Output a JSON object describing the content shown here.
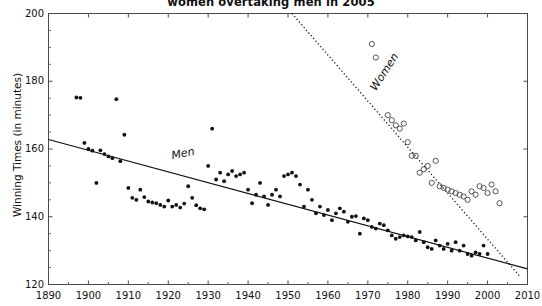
{
  "chart_data": {
    "type": "scatter",
    "title": "women overtaking men in 2005",
    "xlabel": "",
    "ylabel": "Winning Times (in minutes)",
    "xlim": [
      1890,
      2010
    ],
    "ylim": [
      120,
      200
    ],
    "xticks": [
      1890,
      1900,
      1910,
      1920,
      1930,
      1940,
      1950,
      1960,
      1970,
      1980,
      1990,
      2000,
      2010
    ],
    "yticks": [
      120,
      140,
      160,
      180,
      200
    ],
    "grid": false,
    "legend_position": "inline-annotation",
    "annotations": [
      {
        "text": "Men",
        "x": 1921,
        "y": 157,
        "rotation": -11,
        "style": "italic"
      },
      {
        "text": "Women",
        "x": 1972,
        "y": 177,
        "rotation": -57,
        "style": "italic"
      }
    ],
    "series": [
      {
        "name": "Men",
        "marker": "filled-circle",
        "color": "#111111",
        "trendline": {
          "style": "solid",
          "x": [
            1890,
            2010
          ],
          "y": [
            162.8,
            124.6
          ]
        },
        "points": [
          [
            1897,
            175.2
          ],
          [
            1898,
            175.1
          ],
          [
            1899,
            161.8
          ],
          [
            1900,
            160.0
          ],
          [
            1901,
            159.5
          ],
          [
            1902,
            150.0
          ],
          [
            1903,
            159.6
          ],
          [
            1904,
            158.5
          ],
          [
            1905,
            157.8
          ],
          [
            1906,
            157.3
          ],
          [
            1907,
            174.7
          ],
          [
            1908,
            156.4
          ],
          [
            1909,
            164.2
          ],
          [
            1910,
            148.5
          ],
          [
            1911,
            145.6
          ],
          [
            1912,
            145.0
          ],
          [
            1913,
            148.0
          ],
          [
            1914,
            145.8
          ],
          [
            1915,
            144.5
          ],
          [
            1916,
            144.2
          ],
          [
            1917,
            144.0
          ],
          [
            1918,
            143.5
          ],
          [
            1919,
            143.0
          ],
          [
            1920,
            144.8
          ],
          [
            1921,
            143.0
          ],
          [
            1922,
            143.5
          ],
          [
            1923,
            142.7
          ],
          [
            1924,
            143.9
          ],
          [
            1925,
            149.0
          ],
          [
            1926,
            145.6
          ],
          [
            1927,
            143.4
          ],
          [
            1928,
            142.5
          ],
          [
            1929,
            142.2
          ],
          [
            1930,
            155.0
          ],
          [
            1931,
            166.0
          ],
          [
            1932,
            151.0
          ],
          [
            1933,
            153.0
          ],
          [
            1934,
            150.5
          ],
          [
            1935,
            152.5
          ],
          [
            1936,
            153.5
          ],
          [
            1937,
            152.0
          ],
          [
            1938,
            152.5
          ],
          [
            1939,
            153.0
          ],
          [
            1940,
            148.0
          ],
          [
            1941,
            144.0
          ],
          [
            1942,
            146.5
          ],
          [
            1943,
            150.0
          ],
          [
            1944,
            146.0
          ],
          [
            1945,
            143.5
          ],
          [
            1946,
            146.5
          ],
          [
            1947,
            148.0
          ],
          [
            1948,
            146.0
          ],
          [
            1949,
            152.0
          ],
          [
            1950,
            152.5
          ],
          [
            1951,
            153.0
          ],
          [
            1952,
            152.0
          ],
          [
            1953,
            149.5
          ],
          [
            1954,
            143.0
          ],
          [
            1955,
            148.0
          ],
          [
            1956,
            145.0
          ],
          [
            1957,
            141.0
          ],
          [
            1958,
            143.0
          ],
          [
            1959,
            140.5
          ],
          [
            1960,
            142.0
          ],
          [
            1961,
            139.0
          ],
          [
            1962,
            141.0
          ],
          [
            1963,
            142.5
          ],
          [
            1964,
            141.5
          ],
          [
            1965,
            138.5
          ],
          [
            1966,
            140.0
          ],
          [
            1967,
            140.2
          ],
          [
            1968,
            135.0
          ],
          [
            1969,
            139.5
          ],
          [
            1970,
            139.0
          ],
          [
            1971,
            137.0
          ],
          [
            1972,
            136.5
          ],
          [
            1973,
            138.0
          ],
          [
            1974,
            137.5
          ],
          [
            1975,
            136.0
          ],
          [
            1976,
            134.5
          ],
          [
            1977,
            133.5
          ],
          [
            1978,
            134.0
          ],
          [
            1979,
            134.5
          ],
          [
            1980,
            134.2
          ],
          [
            1981,
            134.0
          ],
          [
            1982,
            133.0
          ],
          [
            1983,
            135.5
          ],
          [
            1984,
            132.5
          ],
          [
            1985,
            131.0
          ],
          [
            1986,
            130.5
          ],
          [
            1987,
            133.0
          ],
          [
            1988,
            131.5
          ],
          [
            1989,
            130.5
          ],
          [
            1990,
            132.0
          ],
          [
            1991,
            130.0
          ],
          [
            1992,
            132.5
          ],
          [
            1993,
            130.0
          ],
          [
            1994,
            131.5
          ],
          [
            1995,
            129.0
          ],
          [
            1996,
            128.5
          ],
          [
            1997,
            129.5
          ],
          [
            1998,
            129.0
          ],
          [
            1999,
            131.5
          ],
          [
            2000,
            129.0
          ]
        ]
      },
      {
        "name": "Women",
        "marker": "open-circle",
        "color": "#555555",
        "trendline": {
          "style": "dotted",
          "x": [
            1951,
            2008
          ],
          "y": [
            200.0,
            122.5
          ]
        },
        "points": [
          [
            1971,
            191.0
          ],
          [
            1972,
            187.0
          ],
          [
            1975,
            170.0
          ],
          [
            1976,
            168.5
          ],
          [
            1977,
            167.0
          ],
          [
            1978,
            166.0
          ],
          [
            1979,
            167.5
          ],
          [
            1980,
            162.0
          ],
          [
            1981,
            158.0
          ],
          [
            1982,
            158.0
          ],
          [
            1983,
            153.0
          ],
          [
            1984,
            154.0
          ],
          [
            1985,
            155.0
          ],
          [
            1986,
            150.0
          ],
          [
            1987,
            156.5
          ],
          [
            1988,
            149.0
          ],
          [
            1989,
            148.5
          ],
          [
            1990,
            148.0
          ],
          [
            1991,
            147.5
          ],
          [
            1992,
            147.0
          ],
          [
            1993,
            146.5
          ],
          [
            1994,
            146.0
          ],
          [
            1995,
            145.0
          ],
          [
            1996,
            147.5
          ],
          [
            1997,
            146.5
          ],
          [
            1998,
            149.0
          ],
          [
            1999,
            148.5
          ],
          [
            2000,
            147.0
          ],
          [
            2001,
            149.5
          ],
          [
            2002,
            147.5
          ],
          [
            2003,
            144.0
          ]
        ]
      }
    ]
  }
}
